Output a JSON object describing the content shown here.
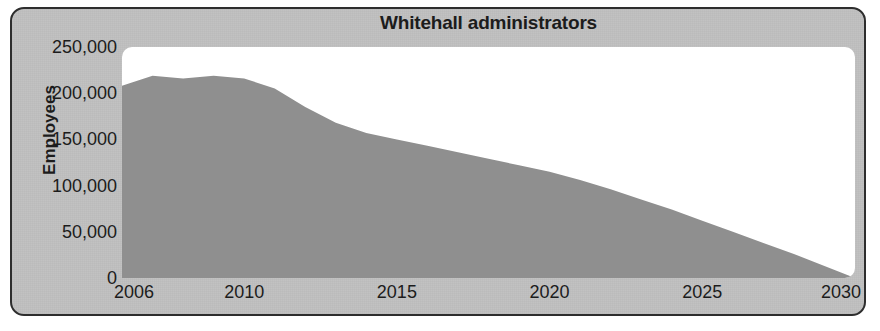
{
  "chart_data": {
    "type": "area",
    "title": "Whitehall administrators",
    "xlabel": "",
    "ylabel": "Employees",
    "xlim": [
      2006,
      2030
    ],
    "ylim": [
      0,
      250000
    ],
    "grid": false,
    "legend": null,
    "xticks": [
      2006,
      2010,
      2015,
      2020,
      2025,
      2030
    ],
    "xtick_labels": [
      "2006",
      "2010",
      "2015",
      "2020",
      "2025",
      "2030"
    ],
    "yticks": [
      0,
      50000,
      100000,
      150000,
      200000,
      250000
    ],
    "ytick_labels": [
      "0",
      "50,000",
      "100,000",
      "150,000",
      "200,000",
      "250,000"
    ],
    "series": [
      {
        "name": "Whitehall administrators",
        "fill_color": "#8f8f8f",
        "x": [
          2006,
          2007,
          2008,
          2009,
          2010,
          2011,
          2012,
          2013,
          2014,
          2015,
          2016,
          2017,
          2018,
          2019,
          2020,
          2021,
          2022,
          2023,
          2024,
          2025,
          2026,
          2027,
          2028,
          2029,
          2030
        ],
        "values": [
          208000,
          219000,
          216000,
          219000,
          216000,
          205000,
          185000,
          168000,
          157000,
          150000,
          143000,
          136000,
          129000,
          122000,
          115000,
          106000,
          96000,
          85000,
          74000,
          62000,
          50000,
          38000,
          26000,
          13000,
          0
        ]
      }
    ]
  },
  "figure": {
    "background_color": "#c2c2c2",
    "plot_background_color": "#ffffff",
    "border_color": "#2e2e2e",
    "text_color": "#1c1c1c"
  }
}
